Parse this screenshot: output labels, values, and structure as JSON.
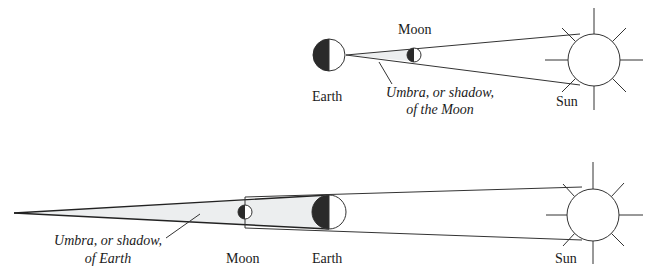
{
  "figure": {
    "colors": {
      "background": "#ffffff",
      "line": "#333333",
      "dark_half": "#2a2a2a",
      "umbra_fill": "#eceeef"
    }
  },
  "solar_eclipse": {
    "labels": {
      "earth": "Earth",
      "moon": "Moon",
      "sun": "Sun",
      "umbra_line1": "Umbra, or shadow,",
      "umbra_line2": "of the Moon"
    }
  },
  "lunar_eclipse": {
    "labels": {
      "earth": "Earth",
      "moon": "Moon",
      "sun": "Sun",
      "umbra_line1": "Umbra, or shadow,",
      "umbra_line2": "of Earth"
    }
  }
}
